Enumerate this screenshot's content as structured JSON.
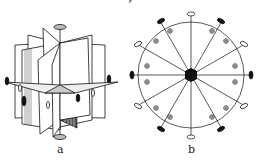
{
  "figures": [
    {
      "id": "a",
      "label": "a",
      "description": "Perspective drawing of symmetry planes radiating around a vertical axis with symmetry elements"
    },
    {
      "id": "b",
      "label": "b",
      "description": "Stereographic projection: circle with 12 radial lines, central hexagonal axis symbol, filled and open ellipses at rim, circled-plus poles"
    }
  ],
  "colors": {
    "ink": "#111111",
    "background": "#ffffff"
  }
}
